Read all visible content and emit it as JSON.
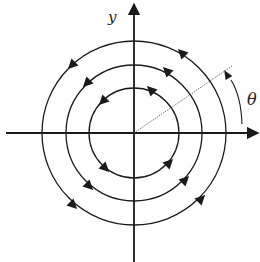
{
  "diagram": {
    "labels": {
      "y_axis": "y",
      "angle": "θ"
    },
    "center": [
      134,
      133
    ],
    "circles": [
      {
        "radius": 45,
        "direction": "counter-clockwise"
      },
      {
        "radius": 68,
        "direction": "counter-clockwise"
      },
      {
        "radius": 92,
        "direction": "counter-clockwise"
      }
    ],
    "arrow_angles_deg": [
      45,
      135,
      225,
      315
    ],
    "reference_line": {
      "style": "dotted",
      "angle_deg": 34
    },
    "colors": {
      "stroke": "#1a1a1a",
      "dotted": "#666666",
      "background": "#ffffff"
    }
  }
}
